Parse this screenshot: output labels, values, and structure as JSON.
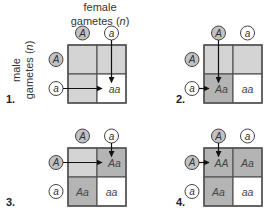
{
  "header": {
    "female_label_line1": "female",
    "female_label_line2": "gametes (",
    "female_label_n": "n",
    "female_label_close": ")",
    "male_label_line1": "male",
    "male_label_line2": "gametes (",
    "male_label_n": "n",
    "male_label_close": ")"
  },
  "colors": {
    "dark_shade": "#b4b4b4",
    "light_shade": "#d4d4d4",
    "white": "#ffffff",
    "grid_line": "#555555",
    "gamete_fill_dominant": "#c2c2c2"
  },
  "panels": [
    {
      "number": "1.",
      "female_gametes": [
        "A",
        "a"
      ],
      "male_gametes": [
        "A",
        "a"
      ],
      "cells": [
        "",
        "",
        "",
        "aa"
      ],
      "shade": [
        "light",
        "light",
        "light",
        "white"
      ],
      "active_female": 1,
      "active_male": 1,
      "target_cell": 3
    },
    {
      "number": "2.",
      "female_gametes": [
        "A",
        "a"
      ],
      "male_gametes": [
        "A",
        "a"
      ],
      "cells": [
        "",
        "",
        "Aa",
        "aa"
      ],
      "shade": [
        "light",
        "light",
        "dark",
        "white"
      ],
      "active_female": 0,
      "active_male": 1,
      "target_cell": 2
    },
    {
      "number": "3.",
      "female_gametes": [
        "A",
        "a"
      ],
      "male_gametes": [
        "A",
        "a"
      ],
      "cells": [
        "",
        "Aa",
        "Aa",
        "aa"
      ],
      "shade": [
        "light",
        "dark",
        "dark",
        "white"
      ],
      "active_female": 1,
      "active_male": 0,
      "target_cell": 1
    },
    {
      "number": "4.",
      "female_gametes": [
        "A",
        "a"
      ],
      "male_gametes": [
        "A",
        "a"
      ],
      "cells": [
        "AA",
        "Aa",
        "Aa",
        "aa"
      ],
      "shade": [
        "dark",
        "dark",
        "dark",
        "white"
      ],
      "active_female": 0,
      "active_male": 0,
      "target_cell": 0
    }
  ]
}
